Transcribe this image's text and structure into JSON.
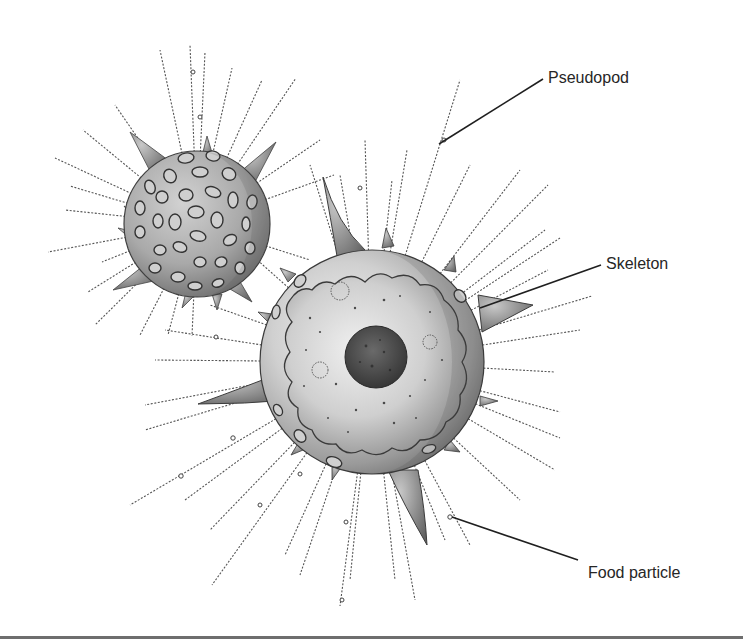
{
  "figure": {
    "colors": {
      "background": "#ffffff",
      "ink": "#262626",
      "shell_fill": "#b9b9b9",
      "shell_dark": "#6a6a6a",
      "shell_light": "#e4e4e4",
      "nucleus": "#4a4a4a",
      "rule": "#6e6e6e"
    },
    "small_organism": {
      "cx": 197,
      "cy": 224,
      "r": 73
    },
    "large_organism": {
      "cx": 372,
      "cy": 362,
      "r": 112
    },
    "nucleus": {
      "cx": 376,
      "cy": 357,
      "r": 31
    }
  },
  "labels": [
    {
      "id": "pseudopod",
      "text": "Pseudopod",
      "x": 548,
      "y": 70,
      "leader": {
        "x1": 543,
        "y1": 79,
        "x2": 439,
        "y2": 144
      }
    },
    {
      "id": "skeleton",
      "text": "Skeleton",
      "x": 606,
      "y": 256,
      "leader": {
        "x1": 601,
        "y1": 265,
        "x2": 480,
        "y2": 308
      }
    },
    {
      "id": "food-particle",
      "text": "Food particle",
      "x": 588,
      "y": 565,
      "leader": {
        "x1": 578,
        "y1": 560,
        "x2": 452,
        "y2": 517
      }
    }
  ]
}
